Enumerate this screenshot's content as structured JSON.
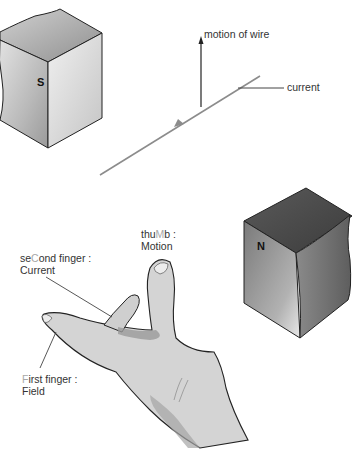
{
  "figure": {
    "magnet_south": {
      "label": "S"
    },
    "magnet_north": {
      "label": "N"
    },
    "wire": {
      "motion_label": "motion of wire",
      "current_label": "current"
    },
    "hand": {
      "thumb": {
        "pre": "thu",
        "key": "M",
        "post": "b :",
        "meaning": "Motion"
      },
      "second_finger": {
        "pre": "se",
        "key": "C",
        "post": "ond finger :",
        "meaning": "Current"
      },
      "first_finger": {
        "pre": "",
        "key": "F",
        "post": "irst finger :",
        "meaning": "Field"
      }
    },
    "colors": {
      "magnet_light": "#e6e6e6",
      "magnet_dark": "#6a6a6a",
      "wire": "#8c8c8c",
      "hand_fill": "#d4d4d4",
      "hand_shadow": "#9a9a9a",
      "outline": "#222222",
      "highlight_letter": "#a8a8a8"
    }
  }
}
